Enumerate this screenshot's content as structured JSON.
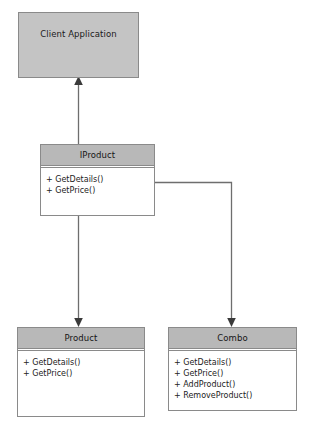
{
  "diagram": {
    "colors": {
      "header_fill": "#b8b8b8",
      "plain_fill": "#c4c4c4",
      "body_fill": "#ffffff",
      "stroke": "#8a8a8a",
      "connector": "#6e6e6e",
      "text": "#1a1a1a"
    }
  },
  "nodes": {
    "client": {
      "name": "Client Application",
      "members": []
    },
    "iproduct": {
      "name": "IProduct",
      "members": [
        "+ GetDetails()",
        "+ GetPrice()"
      ]
    },
    "product": {
      "name": "Product",
      "members": [
        "+ GetDetails()",
        "+ GetPrice()"
      ]
    },
    "combo": {
      "name": "Combo",
      "members": [
        "+ GetDetails()",
        "+ GetPrice()",
        "+ AddProduct()",
        "+ RemoveProduct()"
      ]
    }
  },
  "connectors": [
    {
      "name": "iproduct-to-client",
      "from": "iproduct",
      "to": "client",
      "kind": "association-arrow-up"
    },
    {
      "name": "iproduct-to-product",
      "from": "iproduct",
      "to": "product",
      "kind": "association-arrow-down"
    },
    {
      "name": "iproduct-to-combo",
      "from": "iproduct",
      "to": "combo",
      "kind": "association-elbow-arrow-down"
    }
  ]
}
